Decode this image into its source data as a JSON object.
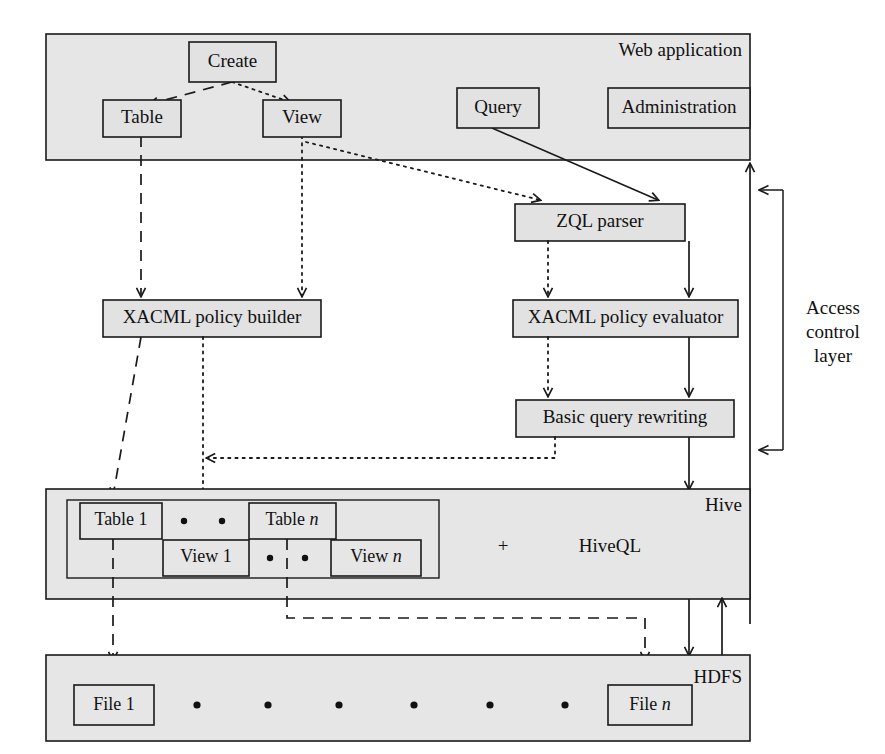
{
  "figure": {
    "type": "architecture-diagram"
  },
  "panels": {
    "web_application": {
      "label": "Web application"
    },
    "hive": {
      "label": "Hive",
      "extra_label": "HiveQL",
      "plus_symbol": "+"
    },
    "hdfs": {
      "label": "HDFS"
    }
  },
  "nodes": {
    "create": "Create",
    "table": "Table",
    "view": "View",
    "query": "Query",
    "administration": "Administration",
    "zql_parser": "ZQL parser",
    "xacml_policy_builder": "XACML policy builder",
    "xacml_policy_evaluator": "XACML policy evaluator",
    "basic_query_rewriting": "Basic query rewriting",
    "table_1": "Table 1",
    "table_n_prefix": "Table ",
    "table_n_suffix": "n",
    "view_1": "View 1",
    "view_n_prefix": "View ",
    "view_n_suffix": "n",
    "file_1": "File 1",
    "file_n_prefix": "File ",
    "file_n_suffix": "n"
  },
  "annotations": {
    "access_control_layer_line1": "Access",
    "access_control_layer_line2": "control",
    "access_control_layer_line3": "layer"
  },
  "colors": {
    "panel_fill": "#e6e6e6",
    "node_fill": "#e2e2e2",
    "stroke": "#1a1a1a",
    "background": "#ffffff"
  },
  "edges": [
    {
      "from": "create",
      "to": "table",
      "style": "dashed",
      "arrow": true
    },
    {
      "from": "create",
      "to": "view",
      "style": "dotted",
      "arrow": true
    },
    {
      "from": "view",
      "to": "zql_parser",
      "style": "dotted",
      "arrow": true
    },
    {
      "from": "query",
      "to": "zql_parser",
      "style": "solid",
      "arrow": true
    },
    {
      "from": "table",
      "to": "xacml_policy_builder",
      "style": "dashed",
      "arrow": true
    },
    {
      "from": "view",
      "to": "xacml_policy_builder",
      "style": "dotted",
      "arrow": true
    },
    {
      "from": "zql_parser",
      "to": "xacml_policy_evaluator",
      "style": "dotted",
      "arrow": true
    },
    {
      "from": "zql_parser",
      "to": "xacml_policy_evaluator",
      "style": "solid",
      "arrow": true
    },
    {
      "from": "xacml_policy_evaluator",
      "to": "basic_query_rewriting",
      "style": "dotted",
      "arrow": true
    },
    {
      "from": "xacml_policy_evaluator",
      "to": "basic_query_rewriting",
      "style": "solid",
      "arrow": true
    },
    {
      "from": "basic_query_rewriting",
      "to": "view_1",
      "style": "dotted",
      "arrow": true
    },
    {
      "from": "basic_query_rewriting",
      "to": "hive",
      "style": "solid",
      "arrow": true
    },
    {
      "from": "xacml_policy_builder",
      "to": "table_1",
      "style": "dashed",
      "arrow": true
    },
    {
      "from": "xacml_policy_builder",
      "to": "view_1",
      "style": "dotted",
      "arrow": true
    },
    {
      "from": "table_1",
      "to": "file_1",
      "style": "dashed",
      "arrow": true
    },
    {
      "from": "table_n",
      "to": "file_n",
      "style": "dashed",
      "arrow": true
    },
    {
      "from": "hive",
      "to": "hdfs",
      "style": "solid",
      "arrow": true
    },
    {
      "from": "hdfs",
      "to": "hive",
      "style": "solid",
      "arrow": true
    },
    {
      "from": "access_control_layer",
      "to": "web_application",
      "style": "solid",
      "arrow": true
    }
  ]
}
